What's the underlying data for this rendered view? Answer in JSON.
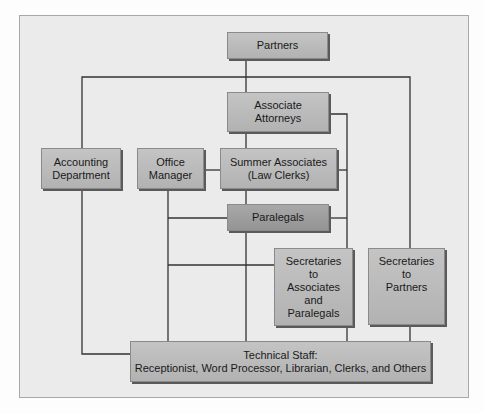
{
  "diagram": {
    "type": "org-chart",
    "nodes": {
      "partners": "Partners",
      "associate_attorneys": "Associate\nAttorneys",
      "accounting": "Accounting\nDepartment",
      "office_manager": "Office\nManager",
      "summer_associates": "Summer Associates\n(Law Clerks)",
      "paralegals": "Paralegals",
      "secretaries_associates": "Secretaries\nto\nAssociates\nand\nParalegals",
      "secretaries_partners": "Secretaries\nto\nPartners",
      "technical_staff": "Technical Staff:\nReceptionist, Word Processor, Librarian, Clerks, and Others"
    },
    "edges": [
      [
        "partners",
        "associate_attorneys"
      ],
      [
        "partners",
        "accounting"
      ],
      [
        "partners",
        "secretaries_partners"
      ],
      [
        "associate_attorneys",
        "summer_associates"
      ],
      [
        "associate_attorneys",
        "secretaries_associates"
      ],
      [
        "office_manager",
        "summer_associates"
      ],
      [
        "summer_associates",
        "paralegals"
      ],
      [
        "office_manager",
        "paralegals"
      ],
      [
        "office_manager",
        "secretaries_associates"
      ],
      [
        "paralegals",
        "technical_staff"
      ],
      [
        "office_manager",
        "technical_staff"
      ],
      [
        "accounting",
        "technical_staff"
      ],
      [
        "secretaries_associates",
        "technical_staff"
      ],
      [
        "secretaries_partners",
        "technical_staff"
      ]
    ],
    "colors": {
      "frame_bg": "#ebebeb",
      "box": "#bbbbbb",
      "box_dark": "#9e9e9e",
      "line": "#333333"
    }
  }
}
